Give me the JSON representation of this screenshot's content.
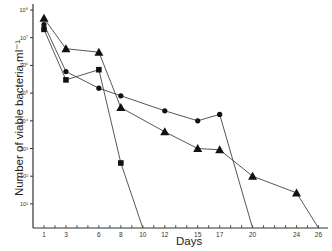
{
  "chart_data": {
    "type": "line",
    "title": "",
    "xlabel": "Days",
    "ylabel": "Number of viable bacteria.ml⁻¹",
    "yscale": "log",
    "ylim": [
      1,
      100000000
    ],
    "xlim": [
      0,
      27
    ],
    "x_ticks": [
      1,
      3,
      6,
      8,
      10,
      12,
      15,
      17,
      20,
      24,
      26
    ],
    "y_ticks": [
      "10⁸",
      "10⁷",
      "10⁶",
      "10⁵",
      "10⁴",
      "10³",
      "10²",
      "10¹"
    ],
    "grid": false,
    "legend": "none",
    "series": [
      {
        "name": "triangle",
        "marker": "triangle",
        "x": [
          1,
          3,
          6,
          8,
          12,
          15,
          17,
          20,
          24,
          26
        ],
        "y": [
          50000000,
          4000000,
          3000000,
          30000,
          4000,
          1000,
          900,
          100,
          25,
          1
        ]
      },
      {
        "name": "circle",
        "marker": "circle",
        "x": [
          1,
          3,
          6,
          8,
          12,
          15,
          17,
          20
        ],
        "y": [
          30000000,
          600000,
          150000,
          80000,
          23000,
          10000,
          17000,
          1
        ]
      },
      {
        "name": "square",
        "marker": "square",
        "x": [
          1,
          3,
          6,
          8,
          10
        ],
        "y": [
          20000000,
          300000,
          700000,
          300,
          1
        ]
      }
    ]
  }
}
